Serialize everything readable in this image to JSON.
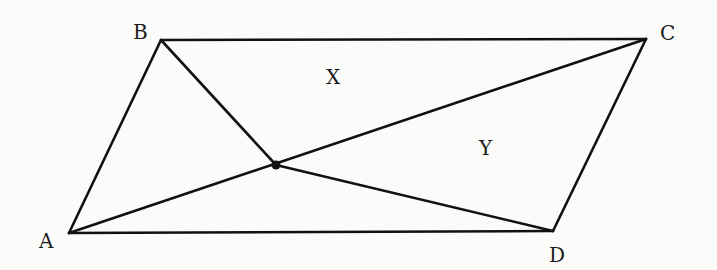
{
  "diagram": {
    "type": "parallelogram-with-interior-point",
    "vertices": {
      "A": {
        "label": "A",
        "x": 69,
        "y": 233
      },
      "B": {
        "label": "B",
        "x": 161,
        "y": 40
      },
      "C": {
        "label": "C",
        "x": 646,
        "y": 39
      },
      "D": {
        "label": "D",
        "x": 553,
        "y": 231
      }
    },
    "interior_point": {
      "x": 276,
      "y": 165
    },
    "regions": {
      "X": {
        "label": "X"
      },
      "Y": {
        "label": "Y"
      }
    },
    "segments": [
      "AB",
      "BC",
      "CD",
      "DA",
      "AC",
      "BP",
      "PD"
    ],
    "stroke_color": "#111111"
  }
}
